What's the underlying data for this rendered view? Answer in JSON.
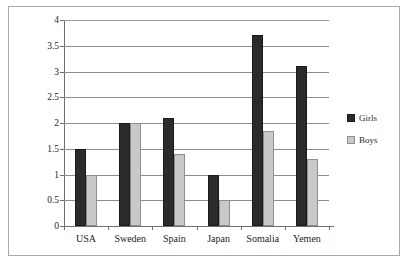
{
  "chart_data": {
    "type": "bar",
    "title": "",
    "xlabel": "",
    "ylabel": "",
    "categories": [
      "USA",
      "Sweden",
      "Spain",
      "Japan",
      "Somalia",
      "Yemen"
    ],
    "series": [
      {
        "name": "Girls",
        "color": "#2b2b2b",
        "values": [
          1.5,
          2.0,
          2.1,
          1.0,
          3.7,
          3.1
        ]
      },
      {
        "name": "Boys",
        "color": "#c9c9c9",
        "values": [
          1.0,
          2.0,
          1.4,
          0.5,
          1.85,
          1.3
        ]
      }
    ],
    "ylim": [
      0,
      4
    ],
    "ytick_step": 0.5,
    "yticks": [
      "0",
      "0.5",
      "1",
      "1.5",
      "2",
      "2.5",
      "3",
      "3.5",
      "4"
    ],
    "grid": true,
    "grid_axis": "y",
    "legend_position": "right",
    "legend": [
      "Girls",
      "Boys"
    ]
  },
  "legend": {
    "entries": [
      {
        "label": "Girls",
        "icon": "filled-square-dark"
      },
      {
        "label": "Boys",
        "icon": "filled-square-light"
      }
    ]
  },
  "frame": {
    "border_color": "#a9a9a9",
    "background": "#ffffff"
  }
}
